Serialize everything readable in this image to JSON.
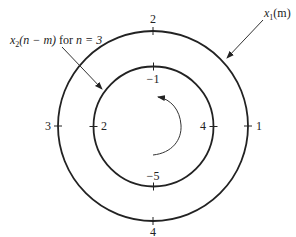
{
  "diagram": {
    "type": "circular-convolution",
    "outer_circle": {
      "label": "x",
      "label_sub": "1",
      "label_arg": "(m)",
      "values": {
        "top": "2",
        "right": "1",
        "bottom": "4",
        "left": "3"
      }
    },
    "inner_circle": {
      "label_pre": "x",
      "label_sub": "2",
      "label_arg": "(n − m)",
      "label_for": " for ",
      "label_cond": "n = 3",
      "values": {
        "top": "−1",
        "right": "4",
        "bottom": "−5",
        "left": "2"
      }
    },
    "rotation_arrow": "counterclockwise"
  }
}
